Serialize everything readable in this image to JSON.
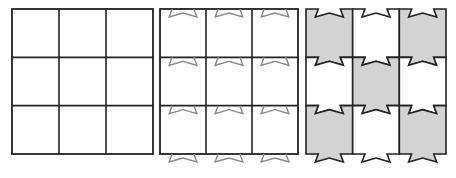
{
  "figure": {
    "panels": [
      {
        "id": "square-grid",
        "x": 12,
        "y": 9,
        "width": 141,
        "height": 145,
        "rows": 3,
        "cols": 3,
        "notches": false,
        "shaded": false
      },
      {
        "id": "notch-outline-grid",
        "x": 160,
        "y": 9,
        "width": 138,
        "height": 145,
        "rows": 3,
        "cols": 3,
        "notches": true,
        "shaded": false
      },
      {
        "id": "interlocking-tile-grid",
        "x": 306,
        "y": 9,
        "width": 140,
        "height": 145,
        "rows": 3,
        "cols": 3,
        "notches": true,
        "shaded": true
      }
    ],
    "colors": {
      "line": "#222222",
      "notch_outline": "#8a8a8a",
      "shade": "#d3d3d3",
      "background": "#ffffff"
    },
    "shading_pattern": [
      [
        1,
        0,
        1
      ],
      [
        0,
        1,
        0
      ],
      [
        1,
        0,
        1
      ]
    ]
  }
}
